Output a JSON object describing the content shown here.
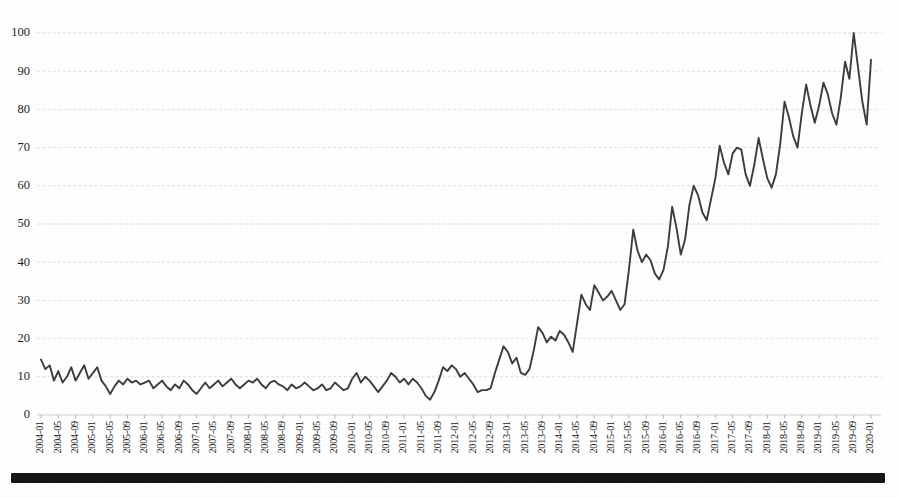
{
  "document": {
    "kind": "scanned-figure-page",
    "footer_rule_visible": true
  },
  "chart_data": {
    "type": "line",
    "title": "",
    "subtitle": "",
    "xlabel": "",
    "ylabel": "",
    "ylim": [
      0,
      100
    ],
    "xlim": [
      "2004-01",
      "2020-01"
    ],
    "grid": true,
    "legend": "none",
    "line_color": "#3c3c3c",
    "grid_color": "#c9c9cf",
    "ytick_labels": [
      "0",
      "10",
      "20",
      "30",
      "40",
      "50",
      "60",
      "70",
      "80",
      "90",
      "100"
    ],
    "ytick_values": [
      0,
      10,
      20,
      30,
      40,
      50,
      60,
      70,
      80,
      90,
      100
    ],
    "xtick_labels": [
      "2004-01",
      "2004-05",
      "2004-09",
      "2005-01",
      "2005-05",
      "2005-09",
      "2006-01",
      "2006-05",
      "2006-09",
      "2007-01",
      "2007-05",
      "2007-09",
      "2008-01",
      "2008-05",
      "2008-09",
      "2009-01",
      "2009-05",
      "2009-09",
      "2010-01",
      "2010-05",
      "2010-09",
      "2011-01",
      "2011-05",
      "2011-09",
      "2012-01",
      "2012-05",
      "2012-09",
      "2013-01",
      "2013-05",
      "2013-09",
      "2014-01",
      "2014-05",
      "2014-09",
      "2015-01",
      "2015-05",
      "2015-09",
      "2016-01",
      "2016-05",
      "2016-09",
      "2017-01",
      "2017-05",
      "2017-09",
      "2018-01",
      "2018-05",
      "2018-09",
      "2019-01",
      "2019-05",
      "2019-09",
      "2020-01"
    ],
    "xtick_interval_months": 4,
    "x": [
      "2004-01",
      "2004-02",
      "2004-03",
      "2004-04",
      "2004-05",
      "2004-06",
      "2004-07",
      "2004-08",
      "2004-09",
      "2004-10",
      "2004-11",
      "2004-12",
      "2005-01",
      "2005-02",
      "2005-03",
      "2005-04",
      "2005-05",
      "2005-06",
      "2005-07",
      "2005-08",
      "2005-09",
      "2005-10",
      "2005-11",
      "2005-12",
      "2006-01",
      "2006-02",
      "2006-03",
      "2006-04",
      "2006-05",
      "2006-06",
      "2006-07",
      "2006-08",
      "2006-09",
      "2006-10",
      "2006-11",
      "2006-12",
      "2007-01",
      "2007-02",
      "2007-03",
      "2007-04",
      "2007-05",
      "2007-06",
      "2007-07",
      "2007-08",
      "2007-09",
      "2007-10",
      "2007-11",
      "2007-12",
      "2008-01",
      "2008-02",
      "2008-03",
      "2008-04",
      "2008-05",
      "2008-06",
      "2008-07",
      "2008-08",
      "2008-09",
      "2008-10",
      "2008-11",
      "2008-12",
      "2009-01",
      "2009-02",
      "2009-03",
      "2009-04",
      "2009-05",
      "2009-06",
      "2009-07",
      "2009-08",
      "2009-09",
      "2009-10",
      "2009-11",
      "2009-12",
      "2010-01",
      "2010-02",
      "2010-03",
      "2010-04",
      "2010-05",
      "2010-06",
      "2010-07",
      "2010-08",
      "2010-09",
      "2010-10",
      "2010-11",
      "2010-12",
      "2011-01",
      "2011-02",
      "2011-03",
      "2011-04",
      "2011-05",
      "2011-06",
      "2011-07",
      "2011-08",
      "2011-09",
      "2011-10",
      "2011-11",
      "2011-12",
      "2012-01",
      "2012-02",
      "2012-03",
      "2012-04",
      "2012-05",
      "2012-06",
      "2012-07",
      "2012-08",
      "2012-09",
      "2012-10",
      "2012-11",
      "2012-12",
      "2013-01",
      "2013-02",
      "2013-03",
      "2013-04",
      "2013-05",
      "2013-06",
      "2013-07",
      "2013-08",
      "2013-09",
      "2013-10",
      "2013-11",
      "2013-12",
      "2014-01",
      "2014-02",
      "2014-03",
      "2014-04",
      "2014-05",
      "2014-06",
      "2014-07",
      "2014-08",
      "2014-09",
      "2014-10",
      "2014-11",
      "2014-12",
      "2015-01",
      "2015-02",
      "2015-03",
      "2015-04",
      "2015-05",
      "2015-06",
      "2015-07",
      "2015-08",
      "2015-09",
      "2015-10",
      "2015-11",
      "2015-12",
      "2016-01",
      "2016-02",
      "2016-03",
      "2016-04",
      "2016-05",
      "2016-06",
      "2016-07",
      "2016-08",
      "2016-09",
      "2016-10",
      "2016-11",
      "2016-12",
      "2017-01",
      "2017-02",
      "2017-03",
      "2017-04",
      "2017-05",
      "2017-06",
      "2017-07",
      "2017-08",
      "2017-09",
      "2017-10",
      "2017-11",
      "2017-12",
      "2018-01",
      "2018-02",
      "2018-03",
      "2018-04",
      "2018-05",
      "2018-06",
      "2018-07",
      "2018-08",
      "2018-09",
      "2018-10",
      "2018-11",
      "2018-12",
      "2019-01",
      "2019-02",
      "2019-03",
      "2019-04",
      "2019-05",
      "2019-06",
      "2019-07",
      "2019-08",
      "2019-09",
      "2019-10",
      "2019-11",
      "2019-12",
      "2020-01"
    ],
    "values": [
      14.5,
      12.0,
      13.0,
      9.0,
      11.5,
      8.5,
      10.0,
      12.5,
      9.0,
      11.0,
      13.0,
      9.5,
      11.0,
      12.5,
      9.0,
      7.5,
      5.5,
      7.5,
      9.0,
      8.0,
      9.5,
      8.5,
      9.0,
      8.0,
      8.5,
      9.0,
      7.0,
      8.0,
      9.0,
      7.5,
      6.5,
      8.0,
      7.0,
      9.0,
      8.0,
      6.5,
      5.5,
      7.0,
      8.5,
      7.0,
      8.0,
      9.0,
      7.5,
      8.5,
      9.5,
      8.0,
      7.0,
      8.0,
      9.0,
      8.5,
      9.5,
      8.0,
      7.0,
      8.5,
      9.0,
      8.0,
      7.5,
      6.5,
      8.0,
      7.0,
      7.5,
      8.5,
      7.5,
      6.5,
      7.0,
      8.0,
      6.5,
      7.0,
      8.5,
      7.5,
      6.5,
      7.0,
      9.5,
      11.0,
      8.5,
      10.0,
      9.0,
      7.5,
      6.0,
      7.5,
      9.0,
      11.0,
      10.0,
      8.5,
      9.5,
      8.0,
      9.5,
      8.5,
      7.0,
      5.0,
      4.0,
      6.0,
      9.0,
      12.5,
      11.5,
      13.0,
      12.0,
      10.0,
      11.0,
      9.5,
      8.0,
      6.0,
      6.5,
      6.5,
      7.0,
      11.0,
      14.5,
      18.0,
      16.5,
      13.5,
      15.0,
      11.0,
      10.5,
      12.0,
      17.0,
      23.0,
      21.5,
      19.0,
      20.5,
      19.5,
      22.0,
      21.0,
      19.0,
      16.5,
      24.0,
      31.5,
      29.0,
      27.5,
      34.0,
      32.0,
      30.0,
      31.0,
      32.5,
      30.0,
      27.5,
      29.0,
      38.0,
      48.5,
      43.0,
      40.0,
      42.0,
      40.5,
      37.0,
      35.5,
      38.0,
      44.0,
      54.5,
      49.0,
      42.0,
      46.0,
      55.0,
      60.0,
      57.5,
      53.0,
      51.0,
      56.5,
      62.0,
      70.5,
      66.0,
      63.0,
      68.5,
      70.0,
      69.5,
      63.0,
      60.0,
      65.5,
      72.5,
      67.0,
      62.0,
      59.5,
      63.0,
      71.0,
      82.0,
      78.0,
      73.0,
      70.0,
      79.0,
      86.5,
      81.0,
      76.5,
      81.0,
      87.0,
      84.0,
      79.0,
      76.0,
      83.0,
      92.5,
      88.0,
      100.0,
      91.0,
      82.0,
      76.0,
      93.0
    ]
  }
}
